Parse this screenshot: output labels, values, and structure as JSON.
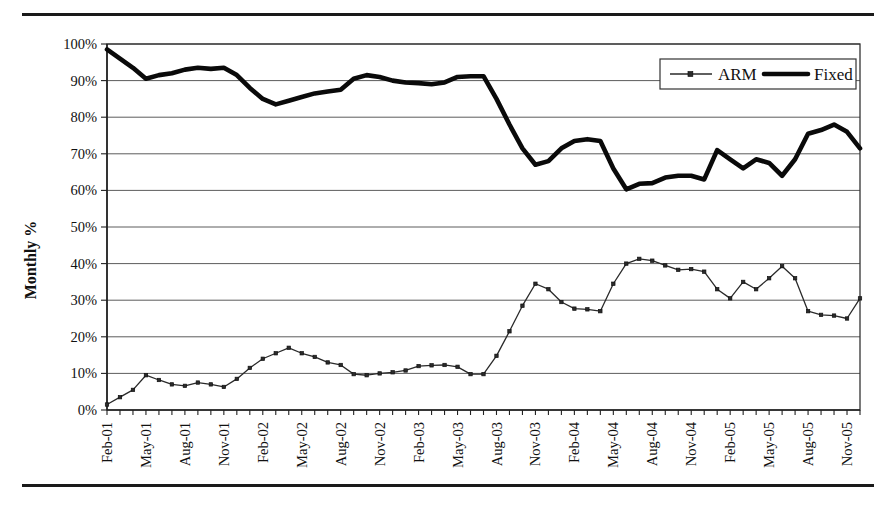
{
  "figure": {
    "top_rule": "horizontal-rule",
    "bottom_rule": "horizontal-rule"
  },
  "chart_data": {
    "type": "line",
    "title": "",
    "xlabel": "",
    "ylabel": "Monthly %",
    "ylim": [
      0,
      100
    ],
    "ytick_labels": [
      "0%",
      "10%",
      "20%",
      "30%",
      "40%",
      "50%",
      "60%",
      "70%",
      "80%",
      "90%",
      "100%"
    ],
    "ytick_values": [
      0,
      10,
      20,
      30,
      40,
      50,
      60,
      70,
      80,
      90,
      100
    ],
    "grid": true,
    "legend_position": "top-right",
    "legend_entries": [
      "ARM",
      "Fixed"
    ],
    "xtick_labels": [
      "Feb-01",
      "May-01",
      "Aug-01",
      "Nov-01",
      "Feb-02",
      "May-02",
      "Aug-02",
      "Nov-02",
      "Feb-03",
      "May-03",
      "Aug-03",
      "Nov-03",
      "Feb-04",
      "May-04",
      "Aug-04",
      "Nov-04",
      "Feb-05",
      "May-05",
      "Aug-05",
      "Nov-05"
    ],
    "x": [
      "Feb-01",
      "Mar-01",
      "Apr-01",
      "May-01",
      "Jun-01",
      "Jul-01",
      "Aug-01",
      "Sep-01",
      "Oct-01",
      "Nov-01",
      "Dec-01",
      "Jan-02",
      "Feb-02",
      "Mar-02",
      "Apr-02",
      "May-02",
      "Jun-02",
      "Jul-02",
      "Aug-02",
      "Sep-02",
      "Oct-02",
      "Nov-02",
      "Dec-02",
      "Jan-03",
      "Feb-03",
      "Mar-03",
      "Apr-03",
      "May-03",
      "Jun-03",
      "Jul-03",
      "Aug-03",
      "Sep-03",
      "Oct-03",
      "Nov-03",
      "Dec-03",
      "Jan-04",
      "Feb-04",
      "Mar-04",
      "Apr-04",
      "May-04",
      "Jun-04",
      "Jul-04",
      "Aug-04",
      "Sep-04",
      "Oct-04",
      "Nov-04",
      "Dec-04",
      "Jan-05",
      "Feb-05",
      "Mar-05",
      "Apr-05",
      "May-05",
      "Jun-05",
      "Jul-05",
      "Aug-05",
      "Sep-05",
      "Oct-05",
      "Nov-05",
      "Dec-05"
    ],
    "series": [
      {
        "name": "ARM",
        "marker": "square",
        "values": [
          1.5,
          3.5,
          5.5,
          9.5,
          8.2,
          7.0,
          6.6,
          7.5,
          7.0,
          6.3,
          8.5,
          11.5,
          14.0,
          15.5,
          17.0,
          15.5,
          14.5,
          13.0,
          12.3,
          9.8,
          9.5,
          10.0,
          10.3,
          10.8,
          12.0,
          12.2,
          12.3,
          11.8,
          9.8,
          9.8,
          14.8,
          21.5,
          28.5,
          34.5,
          33.0,
          29.5,
          27.7,
          27.5,
          27.0,
          34.5,
          40.0,
          41.3,
          40.8,
          39.5,
          38.3,
          38.5,
          37.8,
          33.0,
          30.5,
          35.0,
          33.0,
          36.0,
          39.3,
          36.0,
          27.0,
          26.0,
          25.8,
          25.0,
          30.5
        ]
      },
      {
        "name": "Fixed",
        "marker": "none",
        "values": [
          98.5,
          96.0,
          93.5,
          90.5,
          91.5,
          92.0,
          93.0,
          93.5,
          93.2,
          93.5,
          91.5,
          88.0,
          85.0,
          83.5,
          84.5,
          85.5,
          86.5,
          87.0,
          87.5,
          90.5,
          91.5,
          91.0,
          90.0,
          89.5,
          89.3,
          89.0,
          89.5,
          91.0,
          91.2,
          91.2,
          85.0,
          78.0,
          71.5,
          67.0,
          68.0,
          71.5,
          73.5,
          74.0,
          73.5,
          66.0,
          60.3,
          61.8,
          62.0,
          63.5,
          64.0,
          64.0,
          63.0,
          71.0,
          68.5,
          66.0,
          68.5,
          67.5,
          64.0,
          68.5,
          75.5,
          76.5,
          78.0,
          76.0,
          71.5
        ]
      }
    ]
  }
}
